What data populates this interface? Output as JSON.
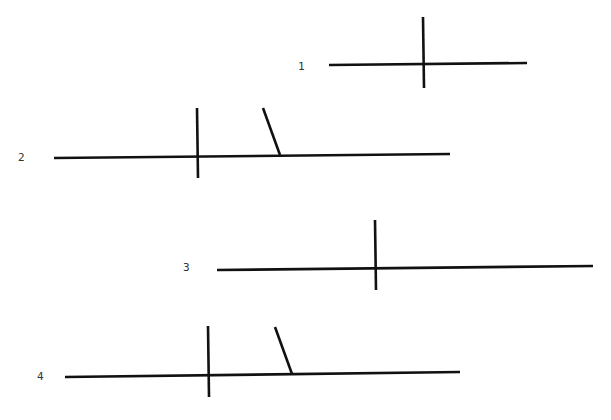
{
  "diagram": {
    "background": "#ffffff",
    "line_color": "#111111",
    "figures": [
      {
        "label": "1",
        "label_pos": [
          298,
          70
        ],
        "segments": [
          {
            "role": "horizontal",
            "x1": 329,
            "y1": 65,
            "x2": 527,
            "y2": 63
          },
          {
            "role": "vertical",
            "x1": 423,
            "y1": 17,
            "x2": 424,
            "y2": 88
          }
        ]
      },
      {
        "label": "2",
        "label_pos": [
          18,
          161
        ],
        "segments": [
          {
            "role": "horizontal",
            "x1": 54,
            "y1": 158,
            "x2": 450,
            "y2": 154
          },
          {
            "role": "vertical",
            "x1": 197,
            "y1": 108,
            "x2": 198,
            "y2": 178
          },
          {
            "role": "slant",
            "x1": 263,
            "y1": 108,
            "x2": 280,
            "y2": 155
          }
        ]
      },
      {
        "label": "3",
        "label_pos": [
          183,
          271
        ],
        "segments": [
          {
            "role": "horizontal",
            "x1": 217,
            "y1": 270,
            "x2": 593,
            "y2": 266
          },
          {
            "role": "vertical",
            "x1": 375,
            "y1": 220,
            "x2": 376,
            "y2": 290
          }
        ]
      },
      {
        "label": "4",
        "label_pos": [
          37,
          380
        ],
        "segments": [
          {
            "role": "horizontal",
            "x1": 65,
            "y1": 377,
            "x2": 460,
            "y2": 372
          },
          {
            "role": "vertical",
            "x1": 208,
            "y1": 326,
            "x2": 209,
            "y2": 397
          },
          {
            "role": "slant",
            "x1": 275,
            "y1": 327,
            "x2": 292,
            "y2": 374
          }
        ]
      }
    ]
  }
}
